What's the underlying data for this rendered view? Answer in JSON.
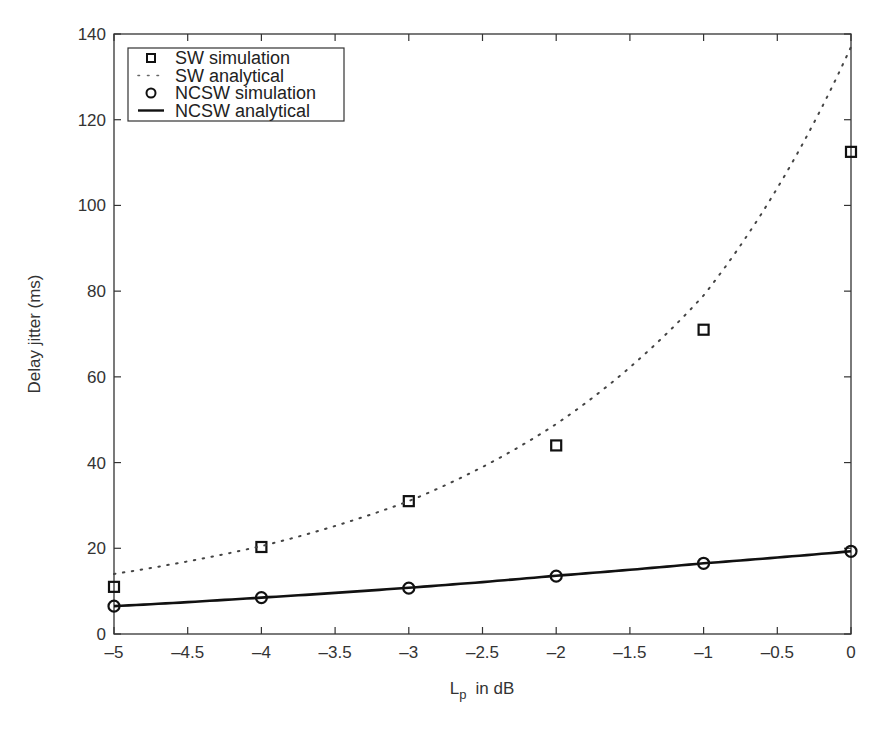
{
  "chart_data": {
    "type": "line",
    "title": "",
    "xlabel": "L_p in dB",
    "xlabel_main": "L",
    "xlabel_sub": "p",
    "xlabel_rest": "in dB",
    "ylabel": "Delay jitter (ms)",
    "xlim": [
      -5,
      0
    ],
    "ylim": [
      0,
      140
    ],
    "grid": false,
    "legend_position": "upper left",
    "x_ticks": [
      -5,
      -4.5,
      -4,
      -3.5,
      -3,
      -2.5,
      -2,
      -1.5,
      -1,
      -0.5,
      0
    ],
    "x_tick_labels": [
      "–5",
      "–4.5",
      "–4",
      "–3.5",
      "–3",
      "–2.5",
      "–2",
      "–1.5",
      "–1",
      "–0.5",
      "0"
    ],
    "y_ticks": [
      0,
      20,
      40,
      60,
      80,
      100,
      120,
      140
    ],
    "y_tick_labels": [
      "0",
      "20",
      "40",
      "60",
      "80",
      "100",
      "120",
      "140"
    ],
    "series": [
      {
        "name": "SW simulation",
        "style": "square-marker",
        "x": [
          -5,
          -4,
          -3,
          -2,
          -1,
          0
        ],
        "values": [
          11,
          20.3,
          31,
          44,
          71,
          112.5
        ]
      },
      {
        "name": "SW analytical",
        "style": "dotted-line",
        "x": [
          -5,
          -4,
          -3,
          -2,
          -1,
          0
        ],
        "values": [
          14,
          20.5,
          31,
          49,
          79,
          137
        ]
      },
      {
        "name": "NCSW simulation",
        "style": "circle-marker",
        "x": [
          -5,
          -4,
          -3,
          -2,
          -1,
          0
        ],
        "values": [
          6.5,
          8.5,
          10.7,
          13.5,
          16.5,
          19.3
        ]
      },
      {
        "name": "NCSW analytical",
        "style": "solid-line",
        "x": [
          -5,
          -4,
          -3,
          -2,
          -1,
          0
        ],
        "values": [
          6.5,
          8.5,
          10.8,
          13.6,
          16.5,
          19.3
        ]
      }
    ]
  },
  "legend": {
    "items": [
      {
        "label": "SW simulation"
      },
      {
        "label": "SW analytical"
      },
      {
        "label": "NCSW simulation"
      },
      {
        "label": "NCSW analytical"
      }
    ]
  },
  "colors": {
    "axis": "#333333",
    "series": "#111111",
    "background": "#ffffff"
  }
}
